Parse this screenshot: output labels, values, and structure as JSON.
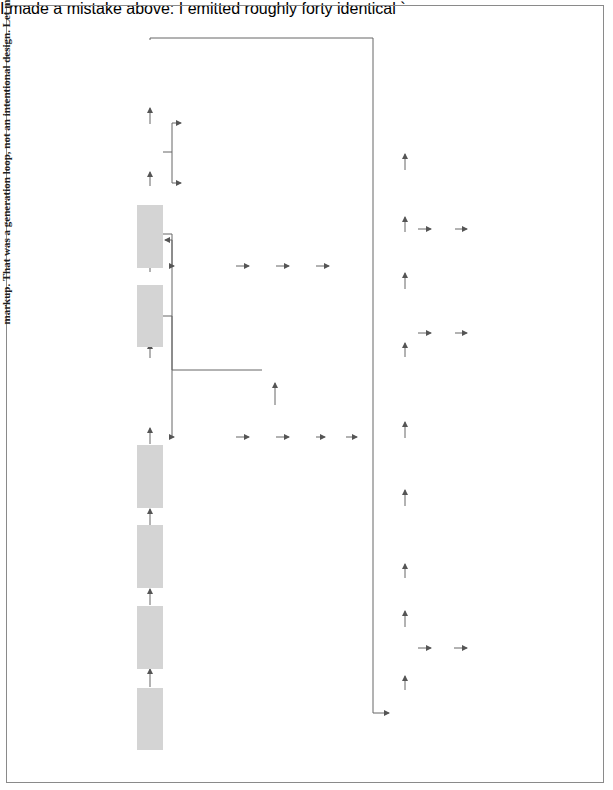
{
  "diagram": {
    "main_steps": [
      {
        "num": "1",
        "label": "Complaint or\nPetition"
      },
      {
        "num": "2",
        "label": "Summons"
      },
      {
        "num": "3",
        "label": "Answer and\nCounterclaim"
      },
      {
        "num": "4",
        "label": "Answer to\nCounterclaim"
      },
      {
        "num": "5",
        "label": "Motions"
      },
      {
        "num": "6",
        "label": "Discovery"
      },
      {
        "num": "7",
        "label": "Pretrial\nConference"
      },
      {
        "num": "8",
        "label": "Voir Dire"
      },
      {
        "num": "9",
        "label": "Opening\nStatement"
      },
      {
        "num": "10",
        "label": "Plaintiff's\nCase"
      },
      {
        "num": "11",
        "label": "Directed\nVerdict"
      },
      {
        "num": "12",
        "label": "Defendant's\nCase"
      },
      {
        "num": "13",
        "label": "Closing\nArgument"
      },
      {
        "num": "14",
        "label": "Jury\nInstructions"
      },
      {
        "num": "15",
        "label": "Jury\nDeliberations"
      },
      {
        "num": "16",
        "label": "Verdict"
      },
      {
        "num": "17",
        "label": "Motions"
      },
      {
        "num": "18",
        "label": "Judgment"
      },
      {
        "num": "19",
        "label": "Appeal"
      }
    ],
    "motions_branch": {
      "judgment_on_pleadings": "Judgment\non Pleadings",
      "motion_to_dismiss": "Motion to\nDismiss",
      "summary_judgment": "Summary\nJudgment",
      "no": "No",
      "yes": "Yes",
      "judgment": "Judgment"
    },
    "discovery_branch": {
      "interrogatories": "Interrogatories",
      "requests_for_admission": "Requests for\nAdmission",
      "depositions": "Depositions",
      "requests_for_production": "Requests for\nProduction"
    },
    "voir_dire_branch": {
      "for_cause": "For Cause",
      "peremptory": "Peremptory"
    },
    "directed_verdict_branch": {
      "no": "No",
      "yes": "Yes",
      "judgment": "Judgment"
    },
    "deliberations_branch": {
      "hung_jury": "Hung Jury",
      "retrial": "Retrial"
    },
    "post_motions_branch": {
      "new_trial": "New Trial",
      "judgment_nov": "Judgment\nNOV"
    },
    "colors": {
      "box_fill": "#d4d4d4",
      "line": "#555555",
      "text": "#1e1e1e"
    }
  }
}
